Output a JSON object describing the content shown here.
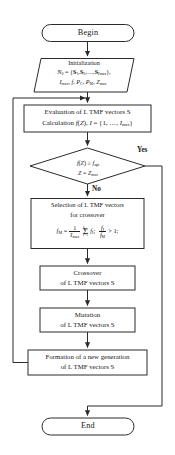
{
  "document": {
    "header_running_text": "",
    "diagram_title": "Genetic algorithm flowchart for LTMF vector optimization"
  },
  "style": {
    "stroke_color": "#2b2b2b",
    "text_color": "#171717",
    "background": "#ffffff",
    "fill_color": "#ffffff"
  },
  "nodes": {
    "begin": {
      "shape": "terminator",
      "label": "Begin"
    },
    "initialization": {
      "shape": "parallelogram",
      "title": "Initialization",
      "line_set": "N0 = {S1, S2,...,SImax},",
      "line_params": "Imax, f, PC, PM, Zmax",
      "symbols": {
        "N": "N",
        "N_sub": "0",
        "S": "S",
        "s1_sub": "1",
        "s2_sub": "2",
        "slast_sub": "Imax",
        "I_italic": "I",
        "I_sub": "max",
        "f_italic": "f",
        "P_italic": "P",
        "PC_sub": "C",
        "PM_sub": "M",
        "Z_italic": "Z",
        "Z_sub": "max"
      }
    },
    "evaluation": {
      "shape": "process",
      "line1": "Evaluation of L TMF vectors S",
      "line2_prefix": "Calculation",
      "line2_fn": "f(Z)",
      "line2_set": "I = {1, ..., Imax}"
    },
    "condition": {
      "shape": "decision",
      "line1": "f(Z) ≥ fopt",
      "line2": "Z = Zmax",
      "operator": "≥"
    },
    "selection": {
      "shape": "process",
      "line1": "Selection of L TMF vectors",
      "line2": "for crossover",
      "formula_text": "fM = (1/Imax) Σ fI;  fI/fM > 1;",
      "formula_parts": {
        "lhs": "f",
        "lhs_sub": "M",
        "equals": "=",
        "frac_num": "1",
        "frac_den": "Imax",
        "sigma": "Σ",
        "sigma_top": "Imax",
        "sigma_bottom": "I=1",
        "term": "fI",
        "semicolon": ";",
        "ratio_num": "fI",
        "ratio_den": "fM",
        "gt": "> 1;"
      }
    },
    "crossover": {
      "shape": "process",
      "line1": "Crossover",
      "line2": "of L TMF vectors S"
    },
    "mutation": {
      "shape": "process",
      "line1": "Mutation",
      "line2": "of L TMF vectors S"
    },
    "formation": {
      "shape": "process",
      "line1": "Formation of a new generation",
      "line2": "of L TMF vectors S"
    },
    "end": {
      "shape": "terminator",
      "label": "End"
    }
  },
  "edges": {
    "yes_label": "Yes",
    "no_label": "No"
  }
}
